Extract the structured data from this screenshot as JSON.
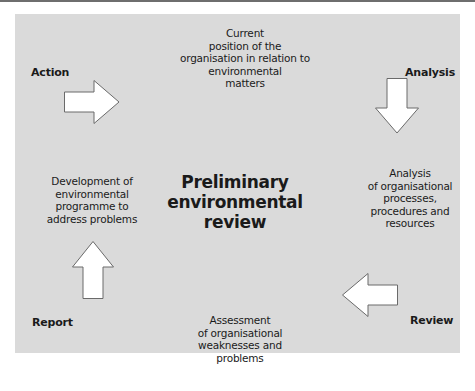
{
  "diagram": {
    "title": "Preliminary environmental review",
    "center_lines": [
      "Preliminary",
      "environmental",
      "review"
    ],
    "colors": {
      "background": "#dadada",
      "page": "#ffffff",
      "arrow_fill": "#ffffff",
      "arrow_stroke": "#6a6a6a",
      "text": "#1a1a1a"
    },
    "corner_labels": {
      "top_left": "Action",
      "top_right": "Analysis",
      "bottom_right": "Review",
      "bottom_left": "Report"
    },
    "nodes": {
      "top": [
        "Current",
        "position of the",
        "organisation in relation to",
        "environmental",
        "matters"
      ],
      "right": [
        "Analysis",
        "of organisational",
        "processes,",
        "procedures and",
        "resources"
      ],
      "bottom": [
        "Assessment",
        "of organisational",
        "weaknesses and",
        "problems"
      ],
      "left": [
        "Development of",
        "environmental",
        "programme to",
        "address problems"
      ]
    },
    "arrows": [
      {
        "name": "arrow-right-icon",
        "direction": "right",
        "from": "left",
        "to": "top"
      },
      {
        "name": "arrow-down-icon",
        "direction": "down",
        "from": "top",
        "to": "right"
      },
      {
        "name": "arrow-left-icon",
        "direction": "left",
        "from": "right",
        "to": "bottom"
      },
      {
        "name": "arrow-up-icon",
        "direction": "up",
        "from": "bottom",
        "to": "left"
      }
    ]
  }
}
